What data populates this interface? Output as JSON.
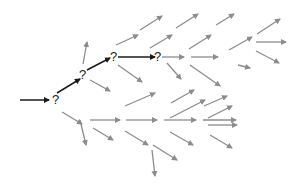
{
  "diagram": {
    "title": "",
    "colors": {
      "path": "#1a1a1a",
      "branch": "#8c8c8c",
      "background": "#ffffff"
    },
    "nodes": [
      {
        "id": "n1",
        "label": "?",
        "x": 52,
        "y": 93
      },
      {
        "id": "n2",
        "label": "?",
        "x": 79,
        "y": 68
      },
      {
        "id": "n3",
        "label": "?",
        "x": 110,
        "y": 50
      },
      {
        "id": "n4",
        "label": "?",
        "x": 154,
        "y": 50
      }
    ],
    "path_arrows": [
      [
        20,
        100,
        49,
        100
      ],
      [
        57,
        93,
        80,
        79
      ],
      [
        87,
        70,
        110,
        58
      ],
      [
        118,
        57,
        155,
        57
      ]
    ],
    "branch_arrows": [
      [
        62,
        112,
        82,
        124
      ],
      [
        80,
        120,
        86,
        145
      ],
      [
        83,
        64,
        87,
        42
      ],
      [
        90,
        80,
        110,
        91
      ],
      [
        116,
        45,
        138,
        35
      ],
      [
        118,
        65,
        142,
        82
      ],
      [
        140,
        30,
        162,
        16
      ],
      [
        176,
        28,
        198,
        14
      ],
      [
        216,
        25,
        234,
        14
      ],
      [
        150,
        48,
        172,
        35
      ],
      [
        189,
        49,
        211,
        35
      ],
      [
        229,
        50,
        252,
        37
      ],
      [
        257,
        34,
        280,
        19
      ],
      [
        256,
        42,
        286,
        42
      ],
      [
        256,
        51,
        279,
        63
      ],
      [
        162,
        57,
        184,
        57
      ],
      [
        191,
        57,
        218,
        57
      ],
      [
        167,
        63,
        181,
        79
      ],
      [
        190,
        65,
        220,
        86
      ],
      [
        238,
        65,
        250,
        68
      ],
      [
        90,
        120,
        120,
        120
      ],
      [
        126,
        120,
        157,
        120
      ],
      [
        164,
        120,
        196,
        120
      ],
      [
        203,
        120,
        236,
        120
      ],
      [
        125,
        106,
        155,
        93
      ],
      [
        171,
        103,
        194,
        90
      ],
      [
        204,
        106,
        227,
        96
      ],
      [
        93,
        128,
        113,
        140
      ],
      [
        125,
        131,
        148,
        145
      ],
      [
        152,
        150,
        155,
        176
      ],
      [
        153,
        145,
        177,
        160
      ],
      [
        170,
        118,
        205,
        100
      ],
      [
        170,
        132,
        193,
        145
      ],
      [
        208,
        118,
        232,
        106
      ],
      [
        208,
        125,
        237,
        125
      ],
      [
        210,
        135,
        232,
        148
      ]
    ]
  }
}
